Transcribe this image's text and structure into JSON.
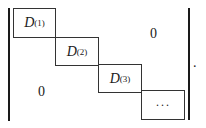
{
  "matrix": {
    "delimiter": "determinant-bars",
    "blocks": [
      {
        "symbol": "D",
        "superscript": "(1)"
      },
      {
        "symbol": "D",
        "superscript": "(2)"
      },
      {
        "symbol": "D",
        "superscript": "(3)"
      },
      {
        "symbol": "···",
        "superscript": ""
      }
    ],
    "upper_right_zero": "0",
    "lower_left_zero": "0",
    "trailing_punctuation": "."
  }
}
